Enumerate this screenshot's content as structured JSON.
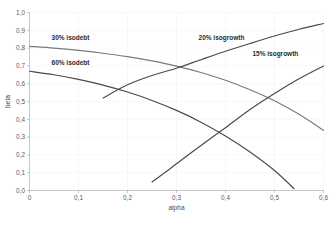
{
  "chart_data": {
    "type": "line",
    "title": "",
    "xlabel": "alpha",
    "ylabel": "beta",
    "xlim": [
      0,
      0.6
    ],
    "ylim": [
      0,
      1.0
    ],
    "grid": true,
    "legend_position": "inline-labels",
    "decimal_separator": ",",
    "x_ticks": [
      "0",
      "0,1",
      "0,2",
      "0,3",
      "0,4",
      "0,5",
      "0,6"
    ],
    "x_tick_values": [
      0,
      0.1,
      0.2,
      0.3,
      0.4,
      0.5,
      0.6
    ],
    "y_ticks": [
      "0,0",
      "0,1",
      "0,2",
      "0,3",
      "0,4",
      "0,5",
      "0,6",
      "0,7",
      "0,8",
      "0,9",
      "1,0"
    ],
    "y_tick_values": [
      0.0,
      0.1,
      0.2,
      0.3,
      0.4,
      0.5,
      0.6,
      0.7,
      0.8,
      0.9,
      1.0
    ],
    "series": [
      {
        "name": "30% isodebt",
        "color": "#7a7a7a",
        "label_x": 0.045,
        "label_y": 0.845,
        "x": [
          0.0,
          0.05,
          0.1,
          0.15,
          0.2,
          0.25,
          0.3,
          0.35,
          0.4,
          0.45,
          0.5,
          0.55,
          0.6
        ],
        "values": [
          0.81,
          0.8,
          0.787,
          0.771,
          0.752,
          0.728,
          0.699,
          0.663,
          0.619,
          0.566,
          0.504,
          0.428,
          0.338
        ]
      },
      {
        "name": "60% isodebt",
        "color": "#4a4a4a",
        "label_x": 0.045,
        "label_y": 0.707,
        "x": [
          0.0,
          0.05,
          0.1,
          0.15,
          0.2,
          0.25,
          0.3,
          0.35,
          0.4,
          0.45,
          0.5,
          0.54
        ],
        "values": [
          0.67,
          0.65,
          0.624,
          0.592,
          0.553,
          0.506,
          0.45,
          0.384,
          0.306,
          0.216,
          0.112,
          0.01
        ]
      },
      {
        "name": "20% isogrowth",
        "color": "#4a4a4a",
        "label_x": 0.345,
        "label_y": 0.845,
        "x": [
          0.15,
          0.2,
          0.25,
          0.3,
          0.35,
          0.4,
          0.45,
          0.5,
          0.55,
          0.6
        ],
        "values": [
          0.52,
          0.594,
          0.646,
          0.687,
          0.735,
          0.782,
          0.826,
          0.868,
          0.906,
          0.938
        ]
      },
      {
        "name": "15% isogrowth",
        "color": "#4a4a4a",
        "label_x": 0.455,
        "label_y": 0.755,
        "x": [
          0.25,
          0.28,
          0.3,
          0.35,
          0.4,
          0.45,
          0.5,
          0.55,
          0.6
        ],
        "values": [
          0.048,
          0.108,
          0.15,
          0.253,
          0.353,
          0.455,
          0.545,
          0.628,
          0.7
        ]
      }
    ]
  }
}
